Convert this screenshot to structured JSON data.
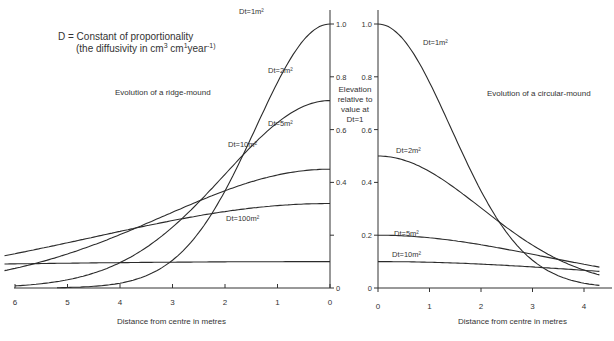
{
  "header": {
    "definition_line1": "D = Constant of proportionality",
    "definition_line2_prefix": "(the diffusivity in cm",
    "definition_line2_sup1": "3",
    "definition_line2_mid": " cm",
    "definition_line2_sup2": "1",
    "definition_line2_suffix": "year",
    "definition_line2_sup3": "-1)"
  },
  "y_axis_label": [
    "Elevation",
    "relative to",
    "value at",
    "Dt=1"
  ],
  "chart_data": [
    {
      "type": "line",
      "title": "Evolution of a ridge-mound",
      "xlabel": "Distance from centre in metres",
      "ylabel": "Elevation relative to value at Dt=1",
      "x_direction": "reversed",
      "xlim": [
        6,
        0
      ],
      "ylim": [
        0,
        1.0
      ],
      "x_ticks": [
        "6",
        "5",
        "4",
        "3",
        "2",
        "1",
        "0"
      ],
      "y_ticks": [
        "0",
        "0.2",
        "0.4",
        "0.6",
        "0.8",
        "1.0"
      ],
      "y_tick_labels_shown": [
        "0",
        "0.4",
        "0.6",
        "0.8",
        "1.0"
      ],
      "grid": false,
      "x": [
        0,
        0.5,
        1,
        1.5,
        2,
        2.5,
        3,
        3.5,
        4,
        4.5,
        5,
        5.5,
        6
      ],
      "series": [
        {
          "name": "Dt=1m²",
          "peak": 1.0,
          "values": [
            1.0,
            0.94,
            0.78,
            0.57,
            0.37,
            0.21,
            0.11,
            0.05,
            0.02,
            0.01,
            0.0,
            0.0,
            0.0
          ]
        },
        {
          "name": "Dt=2m²",
          "peak": 0.71,
          "values": [
            0.71,
            0.69,
            0.62,
            0.53,
            0.43,
            0.32,
            0.23,
            0.15,
            0.1,
            0.06,
            0.03,
            0.02,
            0.01
          ]
        },
        {
          "name": "Dt=5m²",
          "peak": 0.45,
          "values": [
            0.45,
            0.44,
            0.43,
            0.4,
            0.37,
            0.33,
            0.29,
            0.24,
            0.2,
            0.16,
            0.13,
            0.1,
            0.08
          ]
        },
        {
          "name": "Dt=10m²",
          "peak": 0.32,
          "values": [
            0.32,
            0.31,
            0.31,
            0.3,
            0.29,
            0.27,
            0.25,
            0.23,
            0.21,
            0.19,
            0.17,
            0.15,
            0.13
          ]
        },
        {
          "name": "Dt=100m²",
          "peak": 0.1,
          "values": [
            0.1,
            0.1,
            0.1,
            0.1,
            0.1,
            0.1,
            0.1,
            0.1,
            0.1,
            0.1,
            0.1,
            0.1,
            0.1
          ]
        }
      ]
    },
    {
      "type": "line",
      "title": "Evolution of a circular-mound",
      "xlabel": "Distance from centre in metres",
      "ylabel": "Elevation relative to value at Dt=1",
      "xlim": [
        0,
        4.3
      ],
      "ylim": [
        0,
        1.0
      ],
      "x_ticks": [
        "0",
        "1",
        "2",
        "3",
        "4"
      ],
      "y_ticks": [
        "0",
        "0.2",
        "0.4",
        "0.6",
        "0.8",
        "1.0"
      ],
      "grid": false,
      "x": [
        0,
        0.5,
        1,
        1.5,
        2,
        2.5,
        3,
        3.5,
        4,
        4.3
      ],
      "series": [
        {
          "name": "Dt=1m²",
          "peak": 1.0,
          "values": [
            1.0,
            0.94,
            0.78,
            0.57,
            0.37,
            0.21,
            0.11,
            0.05,
            0.02,
            0.01
          ]
        },
        {
          "name": "Dt=2m²",
          "peak": 0.5,
          "values": [
            0.5,
            0.48,
            0.44,
            0.38,
            0.3,
            0.23,
            0.16,
            0.11,
            0.07,
            0.05
          ]
        },
        {
          "name": "Dt=5m²",
          "peak": 0.2,
          "values": [
            0.2,
            0.2,
            0.19,
            0.18,
            0.16,
            0.15,
            0.13,
            0.11,
            0.09,
            0.08
          ]
        },
        {
          "name": "Dt=10m²",
          "peak": 0.1,
          "values": [
            0.1,
            0.1,
            0.1,
            0.09,
            0.09,
            0.09,
            0.08,
            0.07,
            0.07,
            0.06
          ]
        }
      ]
    }
  ]
}
